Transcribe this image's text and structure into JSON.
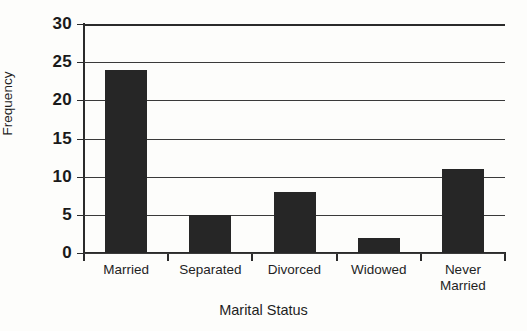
{
  "chart_data": {
    "type": "bar",
    "title": "",
    "xlabel": "Marital Status",
    "ylabel": "Frequency",
    "categories": [
      "Married",
      "Separated",
      "Divorced",
      "Widowed",
      "Never Married"
    ],
    "category_display": [
      "Married",
      "Separated",
      "Divorced",
      "Widowed",
      "Never\nMarried"
    ],
    "values": [
      24,
      5,
      8,
      2,
      11
    ],
    "ylim": [
      0,
      30
    ],
    "yticks": [
      0,
      5,
      10,
      15,
      20,
      25,
      30
    ],
    "ytick_labels": [
      "0",
      "5",
      "10",
      "15",
      "20",
      "25",
      "30"
    ],
    "grid": true,
    "grid_axis": "y",
    "legend": false,
    "bar_color": "#262626",
    "axis_color": "#2b2b2b",
    "background_color": "#fdfdfb"
  },
  "axes": {
    "y_title": "Frequency",
    "x_title": "Marital Status"
  }
}
